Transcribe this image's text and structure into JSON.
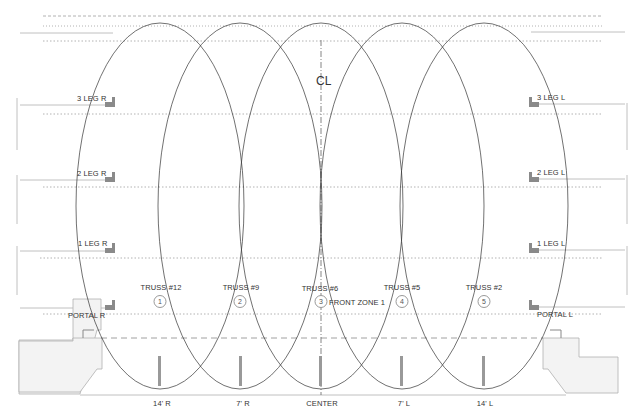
{
  "diagram": {
    "title_marker": "CL",
    "trusses": [
      {
        "label": "TRUSS #12",
        "number": "1",
        "position": "14' R"
      },
      {
        "label": "TRUSS #9",
        "number": "2",
        "position": "7' R"
      },
      {
        "label": "TRUSS #6",
        "number": "3",
        "position": "CENTER"
      },
      {
        "label": "TRUSS #5",
        "number": "4",
        "position": "7' L"
      },
      {
        "label": "TRUSS #2",
        "number": "5",
        "position": "14' L"
      }
    ],
    "zone_label": "FRONT ZONE 1",
    "left_legs": [
      "3 LEG R",
      "2 LEG R",
      "1 LEG R",
      "PORTAL R"
    ],
    "right_legs": [
      "3 LEG L",
      "2 LEG L",
      "1 LEG L",
      "PORTAL L"
    ],
    "colors": {
      "line": "#333333",
      "grey_line": "#b8b8b8",
      "dotted": "#9a9a9a",
      "marker": "#8a8a8a",
      "stage_fill": "#f3f3f3",
      "stage_stroke": "#b0b0b0"
    }
  }
}
